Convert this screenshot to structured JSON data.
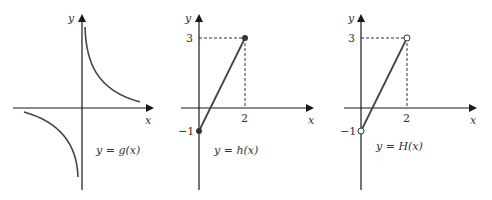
{
  "figures": [
    {
      "id": "g",
      "caption": "y = g(x)",
      "x_axis_label": "x",
      "y_axis_label": "y",
      "description": "Hyperbola-like curve with branches in quadrants I and III"
    },
    {
      "id": "h",
      "caption": "y = h(x)",
      "x_axis_label": "x",
      "y_axis_label": "y",
      "x_tick": "2",
      "y_ticks": [
        "3",
        "−1"
      ],
      "endpoints": [
        {
          "x": 0,
          "y": -1,
          "style": "closed"
        },
        {
          "x": 2,
          "y": 3,
          "style": "closed"
        }
      ]
    },
    {
      "id": "H",
      "caption": "y = H(x)",
      "x_axis_label": "x",
      "y_axis_label": "y",
      "x_tick": "2",
      "y_ticks": [
        "3",
        "−1"
      ],
      "endpoints": [
        {
          "x": 0,
          "y": -1,
          "style": "open"
        },
        {
          "x": 2,
          "y": 3,
          "style": "open"
        }
      ]
    }
  ],
  "colors": {
    "axis": "#1a1a1a",
    "curve": "#444444",
    "dash": "#333333"
  }
}
